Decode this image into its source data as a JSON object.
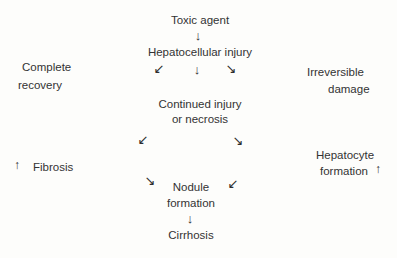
{
  "diagram": {
    "nodes": {
      "toxic_agent": "Toxic agent",
      "hepatocellular_injury": "Hepatocellular injury",
      "complete_recovery": {
        "line1": "Complete",
        "line2": "recovery"
      },
      "irreversible_damage": {
        "line1": "Irreversible",
        "line2": "damage"
      },
      "continued_injury": {
        "line1": "Continued injury",
        "line2": "or necrosis"
      },
      "fibrosis": "Fibrosis",
      "hepatocyte_formation": {
        "line1": "Hepatocyte",
        "line2": "formation"
      },
      "nodule_formation": {
        "line1": "Nodule",
        "line2": "formation"
      },
      "cirrhosis": "Cirrhosis"
    },
    "glyphs": {
      "arrow_down": "↓",
      "arrow_up": "↑",
      "arrow_down_left": "↙",
      "arrow_down_right": "↘"
    },
    "edges": [
      {
        "from": "Toxic agent",
        "to": "Hepatocellular injury"
      },
      {
        "from": "Hepatocellular injury",
        "to": "Complete recovery"
      },
      {
        "from": "Hepatocellular injury",
        "to": "Continued injury or necrosis"
      },
      {
        "from": "Hepatocellular injury",
        "to": "Irreversible damage"
      },
      {
        "from": "Continued injury or necrosis",
        "to": "Fibrosis"
      },
      {
        "from": "Continued injury or necrosis",
        "to": "Hepatocyte formation"
      },
      {
        "from": "Fibrosis",
        "to": "Nodule formation"
      },
      {
        "from": "Hepatocyte formation",
        "to": "Nodule formation"
      },
      {
        "from": "Nodule formation",
        "to": "Cirrhosis"
      }
    ],
    "colors": {
      "background": "#fdfdfb",
      "text": "#333333"
    }
  }
}
